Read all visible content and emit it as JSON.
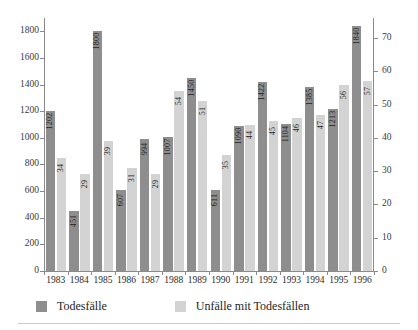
{
  "chart_data": {
    "type": "bar",
    "title": "",
    "xlabel": "",
    "ylabel": "",
    "grid": false,
    "legend_position": "bottom-left",
    "categories": [
      "1983",
      "1984",
      "1985",
      "1986",
      "1987",
      "1988",
      "1989",
      "1990",
      "1991",
      "1992",
      "1993",
      "1994",
      "1995",
      "1996"
    ],
    "series": [
      {
        "name": "Todesfälle",
        "axis": "left",
        "color": "#8e8e8e",
        "values": [
          1202,
          451,
          1800,
          607,
          994,
          1007,
          1450,
          611,
          1090,
          1422,
          1104,
          1385,
          1213,
          1840
        ]
      },
      {
        "name": "Unfälle mit Todesfällen",
        "axis": "right",
        "color": "#d3d3d3",
        "values": [
          34,
          29,
          39,
          31,
          29,
          54,
          51,
          35,
          44,
          45,
          46,
          47,
          56,
          57
        ]
      }
    ],
    "left_axis": {
      "ticks": [
        0,
        200,
        400,
        600,
        800,
        1000,
        1200,
        1400,
        1600,
        1800
      ],
      "tick_labels": [
        "0",
        "200",
        "400",
        "600",
        "800",
        "1000",
        "1200",
        "1400",
        "1600",
        "1800"
      ],
      "ylim": [
        0,
        1900
      ]
    },
    "right_axis": {
      "ticks": [
        0,
        10,
        20,
        30,
        40,
        50,
        60,
        70
      ],
      "tick_labels": [
        "0",
        "10",
        "20",
        "30",
        "40",
        "50",
        "60",
        "70"
      ],
      "ylim": [
        0,
        76
      ]
    }
  },
  "legend": {
    "items": [
      {
        "label": "Todesfälle",
        "color": "#8e8e8e"
      },
      {
        "label": "Unfälle mit Todesfällen",
        "color": "#d3d3d3"
      }
    ]
  }
}
